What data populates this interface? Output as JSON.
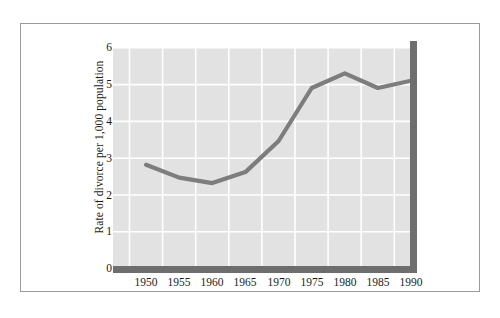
{
  "chart_data": {
    "type": "line",
    "title": "",
    "subtitle": "",
    "xlabel": "",
    "ylabel": "Rate of divorce per 1,000 population",
    "categories": [
      "1950",
      "1955",
      "1960",
      "1965",
      "1970",
      "1975",
      "1980",
      "1985",
      "1990"
    ],
    "x": [
      1950,
      1955,
      1960,
      1965,
      1970,
      1975,
      1980,
      1985,
      1990
    ],
    "values": [
      2.8,
      2.45,
      2.3,
      2.6,
      3.45,
      4.9,
      5.3,
      4.9,
      5.1
    ],
    "series": [
      {
        "name": "Rate of divorce per 1,000 population",
        "values": [
          2.8,
          2.45,
          2.3,
          2.6,
          3.45,
          4.9,
          5.3,
          4.9,
          5.1
        ]
      }
    ],
    "ylim": [
      0,
      6
    ],
    "yticks": [
      "0",
      "1",
      "2",
      "3",
      "4",
      "5",
      "6"
    ],
    "xticks": [
      "1950",
      "1955",
      "1960",
      "1965",
      "1970",
      "1975",
      "1980",
      "1985",
      "1990"
    ],
    "grid": true,
    "legend": "none",
    "colors": {
      "line": "#7d7d7d",
      "panel_background": "#e2e2e2",
      "gridline": "#ffffff",
      "axis_slab": "#6e6e6e",
      "frame_border": "#9a9a9a",
      "text": "#1a1a1a",
      "page_background": "#ffffff"
    }
  },
  "axes": {
    "y_label": "Rate of divorce per 1,000 population",
    "y_ticks": [
      "6",
      "5",
      "4",
      "3",
      "2",
      "1",
      "0"
    ],
    "x_ticks": [
      "1950",
      "1955",
      "1960",
      "1965",
      "1970",
      "1975",
      "1980",
      "1985",
      "1990"
    ]
  }
}
